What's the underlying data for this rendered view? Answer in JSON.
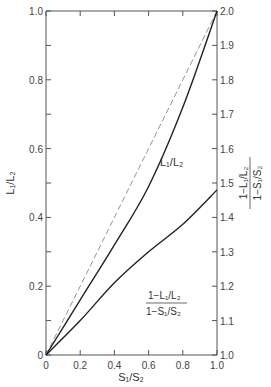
{
  "chart_data": {
    "type": "line",
    "title": "",
    "xlabel": "S1/S2",
    "ylabel_left": "L1/L2",
    "ylabel_right": "(1 - L1/L2) / (1 - S1/S2)",
    "xlim": [
      0,
      1.0
    ],
    "ylim_left": [
      0,
      1.0
    ],
    "ylim_right": [
      1.0,
      2.0
    ],
    "grid": false,
    "x_ticks": [
      "0",
      "0.2",
      "0.4",
      "0.6",
      "0.8",
      "1.0"
    ],
    "y_left_ticks": [
      "0",
      "0.2",
      "0.4",
      "0.6",
      "0.8",
      "1.0"
    ],
    "y_right_ticks": [
      "1.0",
      "1.1",
      "1.2",
      "1.3",
      "1.4",
      "1.5",
      "1.6",
      "1.7",
      "1.8",
      "1.9",
      "2.0"
    ],
    "x": [
      0,
      0.2,
      0.4,
      0.6,
      0.8,
      1.0
    ],
    "series": [
      {
        "name": "diagonal reference",
        "style": "dashed",
        "axis": "left",
        "values": [
          0,
          0.2,
          0.4,
          0.6,
          0.8,
          1.0
        ]
      },
      {
        "name": "L1/L2",
        "style": "solid",
        "axis": "left",
        "values": [
          0,
          0.16,
          0.32,
          0.49,
          0.72,
          1.0
        ]
      },
      {
        "name": "(1-L1/L2)/(1-S1/S2)",
        "style": "solid",
        "axis": "right",
        "values": [
          1.0,
          1.1,
          1.21,
          1.3,
          1.38,
          1.48
        ]
      }
    ],
    "annotations": [
      {
        "text": "L1/L2",
        "near": "upper curve"
      },
      {
        "text": "(1-L1/L2)/(1-S1/S2)",
        "near": "lower curve"
      }
    ]
  },
  "labels": {
    "x_axis": "S₁/S₂",
    "y_left": "L₁/L₂",
    "y_right_num": "1−L₁/L₂",
    "y_right_den": "1−S₁/S₂",
    "curve_upper": "L₁/L₂",
    "curve_lower_num": "1−L₁/L₂",
    "curve_lower_den": "1−S₁/S₂"
  }
}
